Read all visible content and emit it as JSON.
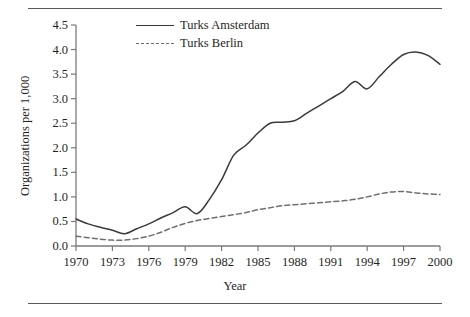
{
  "figure": {
    "xlabel": "Year",
    "ylabel": "Organizations per 1,000"
  },
  "legend": {
    "items": [
      {
        "label": "Turks Amsterdam",
        "style": "solid",
        "color": "#3a3a3a"
      },
      {
        "label": "Turks Berlin",
        "style": "dashed",
        "color": "#6f6f6f"
      }
    ]
  },
  "axes": {
    "y_ticks": [
      "0.0",
      "0.5",
      "1.0",
      "1.5",
      "2.0",
      "2.5",
      "3.0",
      "3.5",
      "4.0",
      "4.5"
    ],
    "x_ticks": [
      "1970",
      "1973",
      "1976",
      "1979",
      "1982",
      "1985",
      "1988",
      "1991",
      "1994",
      "1997",
      "2000"
    ]
  },
  "chart_data": {
    "type": "line",
    "title": "",
    "xlabel": "Year",
    "ylabel": "Organizations per 1,000",
    "xlim": [
      1970,
      2000
    ],
    "ylim": [
      0.0,
      4.5
    ],
    "grid": false,
    "legend_position": "top-center",
    "x": [
      1970,
      1971,
      1972,
      1973,
      1974,
      1975,
      1976,
      1977,
      1978,
      1979,
      1980,
      1981,
      1982,
      1983,
      1984,
      1985,
      1986,
      1987,
      1988,
      1989,
      1990,
      1991,
      1992,
      1993,
      1994,
      1995,
      1996,
      1997,
      1998,
      1999,
      2000
    ],
    "series": [
      {
        "name": "Turks Amsterdam",
        "style": "solid",
        "color": "#3a3a3a",
        "values": [
          0.55,
          0.45,
          0.38,
          0.32,
          0.25,
          0.35,
          0.45,
          0.57,
          0.68,
          0.8,
          0.66,
          0.95,
          1.35,
          1.85,
          2.05,
          2.3,
          2.5,
          2.52,
          2.55,
          2.7,
          2.85,
          3.0,
          3.15,
          3.35,
          3.2,
          3.45,
          3.7,
          3.9,
          3.95,
          3.88,
          3.7
        ]
      },
      {
        "name": "Turks Berlin",
        "style": "dashed",
        "color": "#6f6f6f",
        "values": [
          0.2,
          0.17,
          0.14,
          0.12,
          0.12,
          0.15,
          0.2,
          0.28,
          0.38,
          0.46,
          0.52,
          0.56,
          0.6,
          0.64,
          0.68,
          0.74,
          0.78,
          0.82,
          0.84,
          0.86,
          0.88,
          0.9,
          0.92,
          0.95,
          1.0,
          1.06,
          1.1,
          1.11,
          1.08,
          1.06,
          1.05
        ]
      }
    ]
  }
}
